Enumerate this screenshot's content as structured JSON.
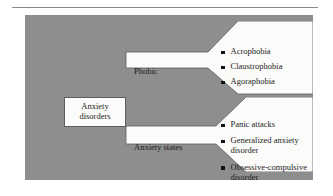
{
  "figure": {
    "name": "anxiety-disorders-classification-diagram",
    "background_color": "#8e8e8e",
    "box_color": "#fbfbf9",
    "text_color": "#1c1c1c",
    "bullet_color": "#111111"
  },
  "root": {
    "line1": "Anxiety",
    "line2": "disorders"
  },
  "branches": [
    {
      "label": "Phobic",
      "items": [
        "Acrophobia",
        "Claustrophobia",
        "Agoraphobia"
      ]
    },
    {
      "label": "Anxiety states",
      "items": [
        "Panic attacks",
        "Generalized anxiety disorder",
        "Obsessive-compulsive disorder"
      ]
    }
  ]
}
